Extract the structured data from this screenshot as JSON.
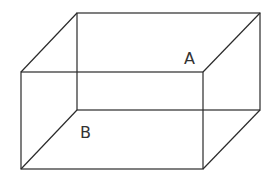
{
  "figure": {
    "type": "rectangular-prism-wireframe",
    "labels": {
      "a": "A",
      "b": "B"
    },
    "vertices": {
      "back_top_left": [
        77,
        13
      ],
      "back_top_right": [
        260,
        13
      ],
      "back_bottom_left": [
        77,
        110
      ],
      "back_bottom_right": [
        260,
        110
      ],
      "front_top_left": [
        21,
        72
      ],
      "front_top_right": [
        203,
        72
      ],
      "front_bottom_left": [
        21,
        169
      ],
      "front_bottom_right": [
        203,
        169
      ]
    },
    "line_color": "#2a2a2a",
    "background": "#ffffff"
  }
}
